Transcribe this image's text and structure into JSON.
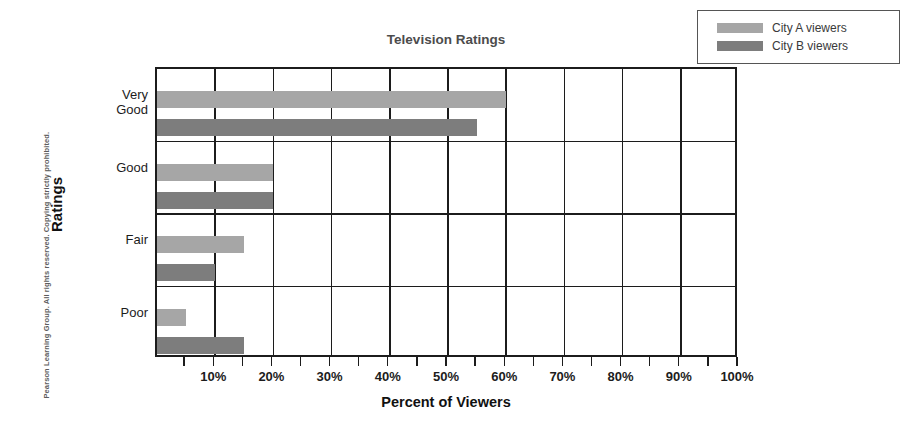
{
  "copyright": "Pearson Learning Group. All rights reserved. Copying strictly prohibited.",
  "legend": {
    "entries": [
      {
        "label": "City A viewers",
        "color": "#a6a6a6"
      },
      {
        "label": "City B viewers",
        "color": "#7d7d7d"
      }
    ]
  },
  "chart_data": {
    "type": "bar",
    "orientation": "horizontal",
    "title": "Television Ratings",
    "xlabel": "Percent of Viewers",
    "ylabel": "Ratings",
    "categories": [
      "Very Good",
      "Good",
      "Fair",
      "Poor"
    ],
    "category_label_lines": [
      [
        "Very",
        "Good"
      ],
      [
        "Good"
      ],
      [
        "Fair"
      ],
      [
        "Poor"
      ]
    ],
    "series": [
      {
        "name": "City A viewers",
        "color": "#a6a6a6",
        "values": [
          60,
          20,
          15,
          5
        ]
      },
      {
        "name": "City B viewers",
        "color": "#7d7d7d",
        "values": [
          55,
          20,
          10,
          15
        ]
      }
    ],
    "xlim": [
      0,
      100
    ],
    "xtick_values": [
      10,
      20,
      30,
      40,
      50,
      60,
      70,
      80,
      90,
      100
    ],
    "xtick_labels": [
      "10%",
      "20%",
      "30%",
      "40%",
      "50%",
      "60%",
      "70%",
      "80%",
      "90%",
      "100%"
    ],
    "minor_tick_values": [
      5,
      10,
      15,
      20,
      25,
      30,
      35,
      40,
      45,
      50,
      55,
      60,
      65,
      70,
      75,
      80,
      85,
      90,
      95,
      100
    ],
    "grid": "vertical-major-and-category-separators",
    "legend_position": "top-right-outside"
  }
}
